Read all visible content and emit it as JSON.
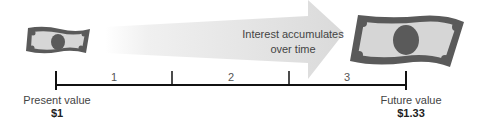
{
  "arrow": {
    "text_line1": "Interest accumulates",
    "text_line2": "over time"
  },
  "timeline": {
    "periods": [
      "1",
      "2",
      "3"
    ]
  },
  "present": {
    "label": "Present value",
    "value": "$1"
  },
  "future": {
    "label": "Future value",
    "value": "$1.33"
  },
  "colors": {
    "bill": "#5a5a5a",
    "bill_inner": "#d8d8d8",
    "arrow": "#dcdcdc",
    "axis": "#111111"
  }
}
